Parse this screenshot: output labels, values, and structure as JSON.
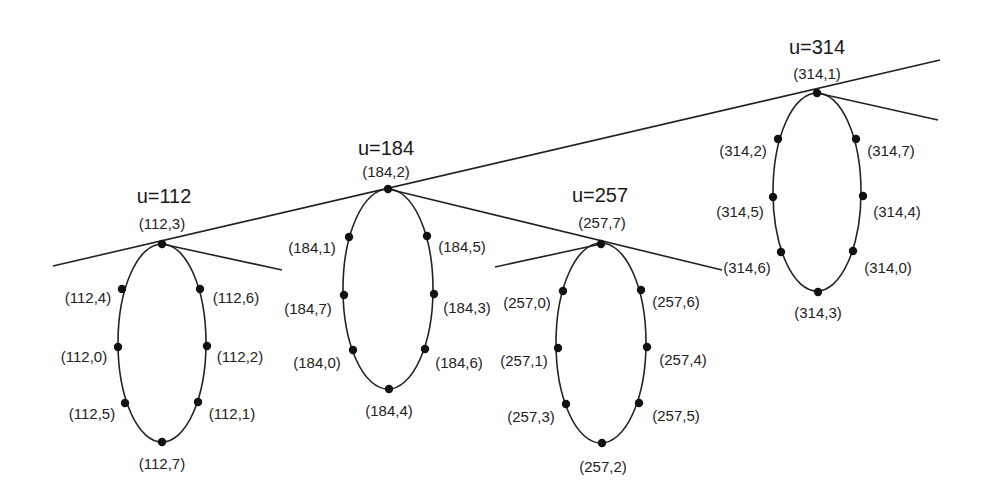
{
  "diagram": {
    "type": "ring-network",
    "stroke_color": "#222222",
    "rings": [
      {
        "id": "u112",
        "title": "u=112",
        "cx": 162,
        "cy": 343,
        "rx": 44,
        "ry": 99,
        "title_pos": [
          164,
          196
        ],
        "nodes": [
          {
            "label": "(112,3)",
            "x": 162,
            "y": 244,
            "lx": 162,
            "ly": 223
          },
          {
            "label": "(112,6)",
            "x": 200,
            "y": 289,
            "lx": 236,
            "ly": 297
          },
          {
            "label": "(112,2)",
            "x": 207,
            "y": 346,
            "lx": 240,
            "ly": 356
          },
          {
            "label": "(112,1)",
            "x": 198,
            "y": 402,
            "lx": 232,
            "ly": 413
          },
          {
            "label": "(112,7)",
            "x": 162,
            "y": 442,
            "lx": 162,
            "ly": 463
          },
          {
            "label": "(112,5)",
            "x": 125,
            "y": 403,
            "lx": 92,
            "ly": 413
          },
          {
            "label": "(112,0)",
            "x": 118,
            "y": 347,
            "lx": 84,
            "ly": 356
          },
          {
            "label": "(112,4)",
            "x": 122,
            "y": 289,
            "lx": 88,
            "ly": 297
          }
        ]
      },
      {
        "id": "u184",
        "title": "u=184",
        "cx": 388,
        "cy": 289,
        "rx": 45,
        "ry": 100,
        "title_pos": [
          386,
          148
        ],
        "nodes": [
          {
            "label": "(184,2)",
            "x": 388,
            "y": 189,
            "lx": 386,
            "ly": 171
          },
          {
            "label": "(184,5)",
            "x": 427,
            "y": 236,
            "lx": 462,
            "ly": 246
          },
          {
            "label": "(184,3)",
            "x": 434,
            "y": 294,
            "lx": 467,
            "ly": 307
          },
          {
            "label": "(184,6)",
            "x": 425,
            "y": 349,
            "lx": 459,
            "ly": 362
          },
          {
            "label": "(184,4)",
            "x": 389,
            "y": 389,
            "lx": 389,
            "ly": 410
          },
          {
            "label": "(184,0)",
            "x": 353,
            "y": 350,
            "lx": 317,
            "ly": 362
          },
          {
            "label": "(184,7)",
            "x": 344,
            "y": 295,
            "lx": 308,
            "ly": 308
          },
          {
            "label": "(184,1)",
            "x": 349,
            "y": 237,
            "lx": 312,
            "ly": 247
          }
        ]
      },
      {
        "id": "u257",
        "title": "u=257",
        "cx": 601,
        "cy": 343,
        "rx": 45,
        "ry": 100,
        "title_pos": [
          600,
          195
        ],
        "nodes": [
          {
            "label": "(257,7)",
            "x": 601,
            "y": 244,
            "lx": 602,
            "ly": 222
          },
          {
            "label": "(257,6)",
            "x": 641,
            "y": 290,
            "lx": 676,
            "ly": 301
          },
          {
            "label": "(257,4)",
            "x": 647,
            "y": 347,
            "lx": 683,
            "ly": 359
          },
          {
            "label": "(257,5)",
            "x": 639,
            "y": 403,
            "lx": 676,
            "ly": 415
          },
          {
            "label": "(257,2)",
            "x": 602,
            "y": 443,
            "lx": 603,
            "ly": 466
          },
          {
            "label": "(257,3)",
            "x": 566,
            "y": 404,
            "lx": 531,
            "ly": 416
          },
          {
            "label": "(257,1)",
            "x": 558,
            "y": 348,
            "lx": 524,
            "ly": 360
          },
          {
            "label": "(257,0)",
            "x": 563,
            "y": 291,
            "lx": 527,
            "ly": 302
          }
        ]
      },
      {
        "id": "u314",
        "title": "u=314",
        "cx": 817,
        "cy": 192,
        "rx": 44,
        "ry": 99,
        "title_pos": [
          817,
          47
        ],
        "nodes": [
          {
            "label": "(314,1)",
            "x": 817,
            "y": 93,
            "lx": 817,
            "ly": 73
          },
          {
            "label": "(314,7)",
            "x": 856,
            "y": 139,
            "lx": 891,
            "ly": 150
          },
          {
            "label": "(314,4)",
            "x": 863,
            "y": 196,
            "lx": 897,
            "ly": 211
          },
          {
            "label": "(314,0)",
            "x": 853,
            "y": 251,
            "lx": 888,
            "ly": 267
          },
          {
            "label": "(314,3)",
            "x": 818,
            "y": 292,
            "lx": 818,
            "ly": 312
          },
          {
            "label": "(314,6)",
            "x": 781,
            "y": 252,
            "lx": 747,
            "ly": 267
          },
          {
            "label": "(314,5)",
            "x": 773,
            "y": 197,
            "lx": 740,
            "ly": 211
          },
          {
            "label": "(314,2)",
            "x": 778,
            "y": 139,
            "lx": 743,
            "ly": 150
          }
        ]
      }
    ],
    "lines": [
      {
        "id": "main-line",
        "x1": 53,
        "y1": 266,
        "x2": 940,
        "y2": 60
      },
      {
        "id": "branch-112",
        "x1": 162,
        "y1": 244,
        "x2": 282,
        "y2": 270
      },
      {
        "id": "branch-184",
        "x1": 388,
        "y1": 189,
        "x2": 722,
        "y2": 270
      },
      {
        "id": "branch-257-left",
        "x1": 495,
        "y1": 267,
        "x2": 601,
        "y2": 244
      },
      {
        "id": "branch-314",
        "x1": 817,
        "y1": 93,
        "x2": 938,
        "y2": 120
      }
    ]
  }
}
